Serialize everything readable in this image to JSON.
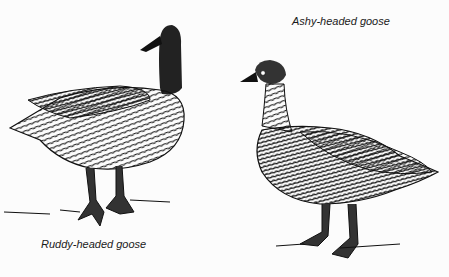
{
  "illustration": {
    "style": "black-and-white pen drawing",
    "subjects": [
      {
        "name": "Ruddy-headed goose",
        "caption": "Ruddy-headed goose",
        "position": "left"
      },
      {
        "name": "Ashy-headed goose",
        "caption": "Ashy-headed goose",
        "position": "right"
      }
    ]
  },
  "colors": {
    "ink": "#111111",
    "paper": "#fcfcfc"
  }
}
